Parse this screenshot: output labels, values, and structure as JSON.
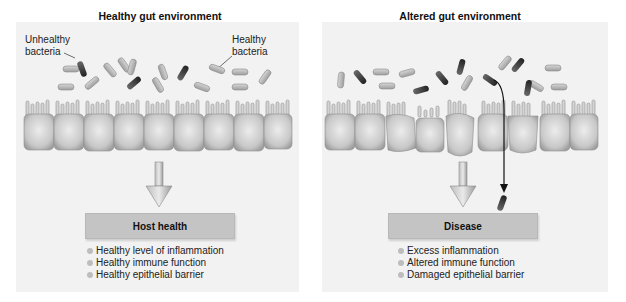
{
  "left_panel": {
    "title": "Healthy gut environment",
    "labels": {
      "unhealthy": [
        "Unhealthy",
        "bacteria"
      ],
      "healthy": [
        "Healthy",
        "bacteria"
      ]
    },
    "outcome_box": "Host health",
    "outcomes": [
      "Healthy level of inflammation",
      "Healthy immune function",
      "Healthy epithelial barrier"
    ]
  },
  "right_panel": {
    "title": "Altered gut environment",
    "outcome_box": "Disease",
    "outcomes": [
      "Excess inflammation",
      "Altered immune function",
      "Damaged epithelial barrier"
    ]
  },
  "colors": {
    "panel_bg": "#f2f2f2",
    "healthy_bacteria": "#b5b5b5",
    "unhealthy_bacteria": "#3a3a3a",
    "epithelial_cell": "#cfcfcf",
    "box_fill": "#c4c4c4"
  }
}
